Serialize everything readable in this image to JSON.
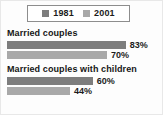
{
  "legend": {
    "items": [
      {
        "label": "1981",
        "color": "#7d7d7d",
        "swatch_name": "legend-swatch-1981"
      },
      {
        "label": "2001",
        "color": "#a9a9a9",
        "swatch_name": "legend-swatch-2001"
      }
    ]
  },
  "chart_data": {
    "type": "bar",
    "orientation": "horizontal",
    "title": "",
    "xlabel": "",
    "ylabel": "",
    "xlim": [
      0,
      100
    ],
    "grid": false,
    "legend_position": "top-center",
    "units": "%",
    "categories": [
      "Married couples",
      "Married couples with children"
    ],
    "series": [
      {
        "name": "1981",
        "color": "#7d7d7d",
        "values": [
          83,
          70
        ]
      },
      {
        "name": "2001",
        "color": "#a9a9a9",
        "values": [
          83,
          44
        ]
      }
    ],
    "groups": [
      {
        "label": "Married couples",
        "bars": [
          {
            "series": "1981",
            "value": 83,
            "value_label": "83%",
            "color": "#7d7d7d",
            "width_pct": 83
          },
          {
            "series": "2001",
            "value": 70,
            "value_label": "70%",
            "color": "#a9a9a9",
            "width_pct": 70
          }
        ]
      },
      {
        "label": "Married couples with children",
        "bars": [
          {
            "series": "1981",
            "value": 60,
            "value_label": "60%",
            "color": "#7d7d7d",
            "width_pct": 60
          },
          {
            "series": "2001",
            "value": 44,
            "value_label": "44%",
            "color": "#a9a9a9",
            "width_pct": 44
          }
        ]
      }
    ]
  }
}
